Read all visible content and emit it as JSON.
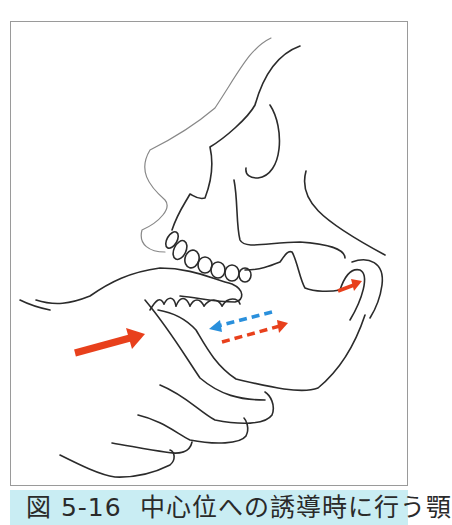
{
  "figure": {
    "label": "図 5-16",
    "caption": "中心位への誘導時に行う顎",
    "colors": {
      "frame_border": "#9a9a9a",
      "caption_bg": "#c9edf3",
      "line": "#2b2b2b",
      "arrow_red": "#e8401c",
      "arrow_blue": "#2a90dc"
    }
  },
  "arrows": [
    {
      "name": "large-push-arrow",
      "color": "red",
      "style": "solid",
      "direction": "right-up"
    },
    {
      "name": "mandible-back-arrow",
      "color": "blue",
      "style": "dashed",
      "direction": "left"
    },
    {
      "name": "mandible-forward-arrow",
      "color": "red",
      "style": "dashed",
      "direction": "right"
    },
    {
      "name": "condyle-arrow",
      "color": "red",
      "style": "solid",
      "direction": "right"
    }
  ]
}
